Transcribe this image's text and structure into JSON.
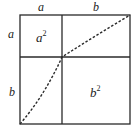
{
  "diagram": {
    "type": "geometric-square-decomposition",
    "top_labels": [
      "a",
      "b"
    ],
    "left_labels": [
      "a",
      "b"
    ],
    "regions": [
      {
        "name": "a-squared",
        "label": "a",
        "exponent": "2"
      },
      {
        "name": "b-squared",
        "label": "b",
        "exponent": "2"
      }
    ],
    "diagonal": "dashed line from bottom-left corner through inner intersection to top-right corner",
    "colors": {
      "line": "#2a2a2a",
      "background": "#ffffff"
    }
  }
}
